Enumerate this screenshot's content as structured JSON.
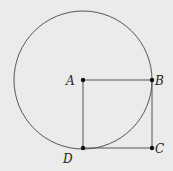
{
  "diagram": {
    "type": "geometry",
    "background": "#ebebea",
    "stroke_color": "#555555",
    "circle": {
      "center": "A",
      "cx": 83,
      "cy": 80,
      "r": 69
    },
    "points": [
      {
        "name": "A",
        "x": 83,
        "y": 80,
        "label_x": 70,
        "label_y": 85
      },
      {
        "name": "B",
        "x": 152,
        "y": 80,
        "label_x": 155,
        "label_y": 84
      },
      {
        "name": "C",
        "x": 152,
        "y": 148,
        "label_x": 155,
        "label_y": 152
      },
      {
        "name": "D",
        "x": 83,
        "y": 148,
        "label_x": 64,
        "label_y": 164
      }
    ],
    "segments": [
      [
        "A",
        "B"
      ],
      [
        "B",
        "C"
      ],
      [
        "C",
        "D"
      ],
      [
        "D",
        "A"
      ]
    ]
  }
}
